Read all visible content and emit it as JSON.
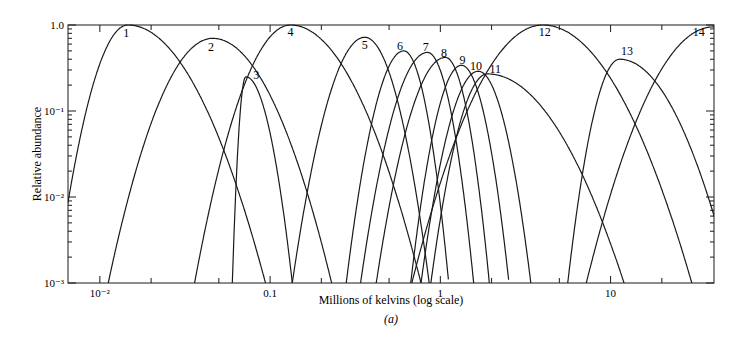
{
  "chart_data": {
    "type": "line",
    "title": "",
    "caption": "(a)",
    "xlabel": "Millions of kelvins (log scale)",
    "ylabel": "Relative abundance",
    "xscale": "log",
    "yscale": "log",
    "xlim": [
      0.0065,
      40.5
    ],
    "ylim": [
      0.001,
      1.0
    ],
    "grid": false,
    "legend": "none (curves labeled inline 1-14)",
    "x_ticks": [
      {
        "value": 0.01,
        "label": "10⁻²"
      },
      {
        "value": 0.1,
        "label": "0.1"
      },
      {
        "value": 1,
        "label": "1"
      },
      {
        "value": 10,
        "label": "10"
      }
    ],
    "y_ticks": [
      {
        "value": 1.0,
        "label": "1.0"
      },
      {
        "value": 0.1,
        "label": "10⁻¹"
      },
      {
        "value": 0.01,
        "label": "10⁻²"
      },
      {
        "value": 0.001,
        "label": "10⁻³"
      }
    ],
    "series": [
      {
        "name": "1",
        "peak_T": 0.0146,
        "peak_abundance": 1.0,
        "T_left_1e-3": 0.0055,
        "T_right_1e-3": 0.094,
        "label_pos": [
          0.0143,
          0.8
        ]
      },
      {
        "name": "2",
        "peak_T": 0.046,
        "peak_abundance": 0.7,
        "T_left_1e-3": 0.0112,
        "T_right_1e-3": 0.23,
        "label_pos": [
          0.045,
          0.55
        ]
      },
      {
        "name": "3",
        "peak_T": 0.072,
        "peak_abundance": 0.25,
        "T_left_1e-3": 0.06,
        "T_right_1e-3": 0.135,
        "label_pos": [
          0.083,
          0.26
        ]
      },
      {
        "name": "4",
        "peak_T": 0.132,
        "peak_abundance": 1.0,
        "T_left_1e-3": 0.036,
        "T_right_1e-3": 0.77,
        "label_pos": [
          0.132,
          0.82
        ]
      },
      {
        "name": "5",
        "peak_T": 0.36,
        "peak_abundance": 0.72,
        "T_left_1e-3": 0.135,
        "T_right_1e-3": 0.86,
        "label_pos": [
          0.36,
          0.58
        ]
      },
      {
        "name": "6",
        "peak_T": 0.61,
        "peak_abundance": 0.5,
        "T_left_1e-3": 0.28,
        "T_right_1e-3": 1.12,
        "label_pos": [
          0.58,
          0.57
        ]
      },
      {
        "name": "7",
        "peak_T": 0.84,
        "peak_abundance": 0.48,
        "T_left_1e-3": 0.34,
        "T_right_1e-3": 1.57,
        "label_pos": [
          0.82,
          0.56
        ]
      },
      {
        "name": "8",
        "peak_T": 1.07,
        "peak_abundance": 0.42,
        "T_left_1e-3": 0.42,
        "T_right_1e-3": 1.94,
        "label_pos": [
          1.05,
          0.47
        ]
      },
      {
        "name": "9",
        "peak_T": 1.33,
        "peak_abundance": 0.34,
        "T_left_1e-3": 0.67,
        "T_right_1e-3": 2.53,
        "label_pos": [
          1.35,
          0.39
        ]
      },
      {
        "name": "10",
        "peak_T": 1.67,
        "peak_abundance": 0.29,
        "T_left_1e-3": 0.77,
        "T_right_1e-3": 3.4,
        "label_pos": [
          1.62,
          0.33
        ]
      },
      {
        "name": "11",
        "peak_T": 1.89,
        "peak_abundance": 0.27,
        "T_left_1e-3": 0.88,
        "T_right_1e-3": 12.0,
        "label_pos": [
          2.1,
          0.31
        ]
      },
      {
        "name": "12",
        "peak_T": 4.0,
        "peak_abundance": 1.0,
        "T_left_1e-3": 0.68,
        "T_right_1e-3": 30.0,
        "label_pos": [
          4.1,
          0.82
        ]
      },
      {
        "name": "13",
        "peak_T": 11.3,
        "peak_abundance": 0.4,
        "T_left_1e-3": 5.6,
        "T_right_1e-3": 52.0,
        "label_pos": [
          12.5,
          0.5
        ]
      },
      {
        "name": "14",
        "peak_T": 40.0,
        "peak_abundance": 0.95,
        "T_left_1e-3": 7.2,
        "T_right_1e-3": null,
        "label_pos": [
          33.0,
          0.82
        ]
      }
    ]
  }
}
